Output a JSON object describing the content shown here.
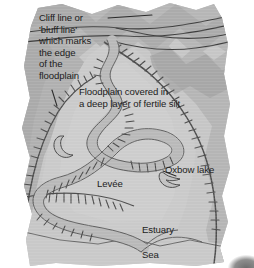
{
  "figure": {
    "type": "block-diagram",
    "background_color": "#ffffff"
  },
  "labels": {
    "cliff": "Cliff line or\n'bluff line'\nwhich marks\nthe edge\nof the\nfloodplain",
    "floodplain": "Floodplain covered in\na deep layer of fertile silt",
    "levee": "Levée",
    "oxbow": "Oxbow lake",
    "estuary": "Estuary",
    "sea": "Sea"
  },
  "colors": {
    "upland_dark": "#a8a8a8",
    "upland_mid": "#b8b8b8",
    "floodplain": "#c6c6c6",
    "valley_light": "#d2d2d2",
    "sea": "#c9c9c9",
    "river": "#bfbfbf",
    "line_dark": "#4a4a4a",
    "line_mid": "#6f6f6f",
    "text": "#1c1c1c",
    "paper": "#ffffff"
  },
  "features": {
    "river_label": "meandering river channel",
    "bluff_left_label": "left bluff line with hachures",
    "bluff_right_label": "right bluff line with hachures",
    "oxbow_lake_label": "oxbow lake crescent",
    "oxbow_old_label": "abandoned meander crescent",
    "levee_label": "levee hachures",
    "coastline_label": "coastline",
    "ridge_label": "distant valley ridge lines"
  }
}
